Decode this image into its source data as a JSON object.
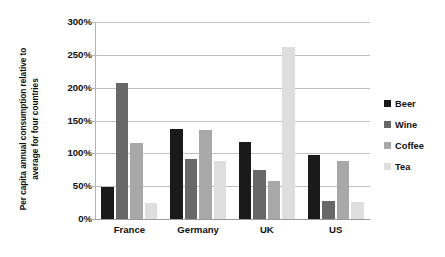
{
  "chart_data": {
    "type": "bar",
    "title": "",
    "subtitle": "",
    "xlabel": "",
    "ylabel": "Per capita annual consumption relative to average for four countries",
    "ylabel_line1": "Per capita annual consumption relative to",
    "ylabel_line2": "average for four countries",
    "categories": [
      "France",
      "Germany",
      "UK",
      "US"
    ],
    "series": [
      {
        "name": "Beer",
        "color": "#1a1a1a",
        "values": [
          49,
          137,
          118,
          97
        ]
      },
      {
        "name": "Wine",
        "color": "#686868",
        "values": [
          207,
          91,
          75,
          27
        ]
      },
      {
        "name": "Coffee",
        "color": "#a8a8a8",
        "values": [
          115,
          135,
          58,
          89
        ]
      },
      {
        "name": "Tea",
        "color": "#dedede",
        "values": [
          24,
          88,
          262,
          26
        ]
      }
    ],
    "ylim": [
      0,
      300
    ],
    "ytick_values": [
      0,
      50,
      100,
      150,
      200,
      250,
      300
    ],
    "ytick_labels": [
      "0%",
      "50%",
      "100%",
      "150%",
      "200%",
      "250%",
      "300%"
    ],
    "grid": true,
    "grid_axis": "y",
    "legend_position": "right",
    "legend_entries": [
      "Beer",
      "Wine",
      "Coffee",
      "Tea"
    ],
    "value_suffix": "%",
    "background_color": "#ffffff",
    "gridline_color": "#bfbfbf",
    "axis_color": "#b4b4b4",
    "text_color": "#111111"
  }
}
